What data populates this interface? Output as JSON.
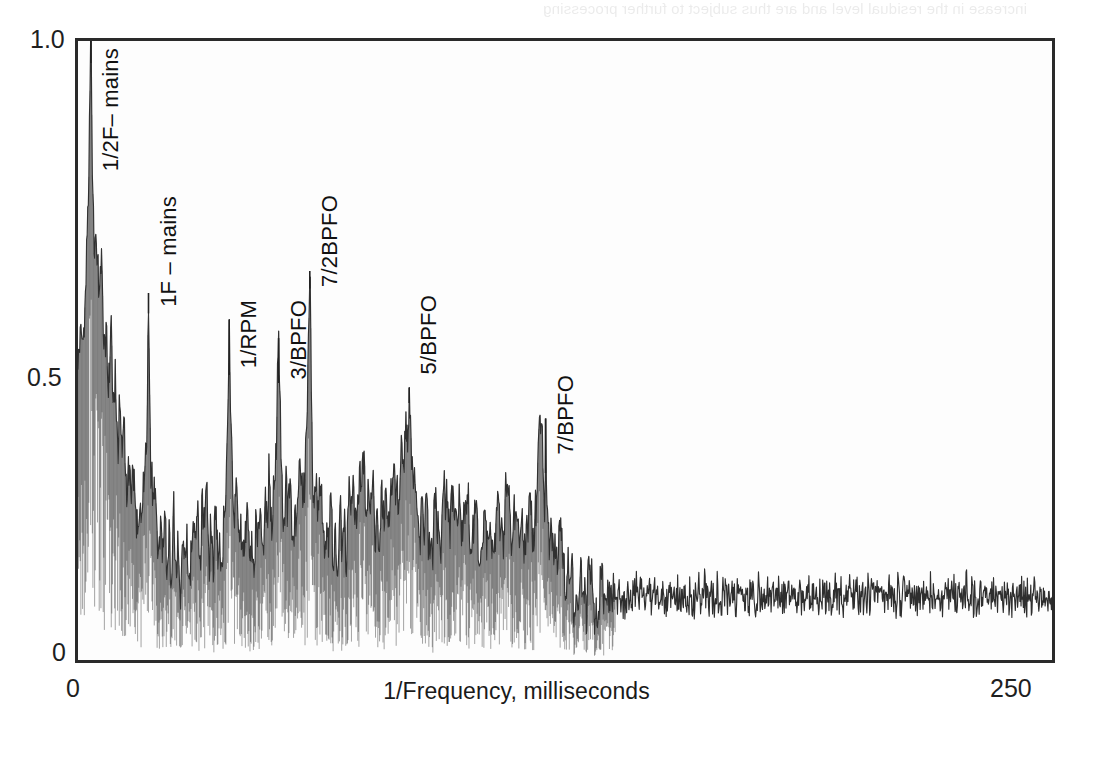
{
  "figure": {
    "title_line1": "A Cepstrum indicating peaks",
    "title_line2": "of families of harmonics"
  },
  "axes": {
    "y_tick_top": "1.0",
    "y_tick_mid": "0.5",
    "y_tick_bottom": "0",
    "x_tick_left": "0",
    "x_tick_right": "250",
    "x_title": "1/Frequency, milliseconds"
  },
  "annotations": [
    {
      "label": "1/2F– mains",
      "x_ms": 3.3
    },
    {
      "label": "1F – mains",
      "x_ms": 18.1
    },
    {
      "label": "1/RPM",
      "x_ms": 38.8
    },
    {
      "label": "3/BPFO",
      "x_ms": 51.5
    },
    {
      "label": "7/2BPFO",
      "x_ms": 59.5
    },
    {
      "label": "5/BPFO",
      "x_ms": 85.0
    },
    {
      "label": "7/BPFO",
      "x_ms": 120.0
    }
  ],
  "bleed_through": {
    "top_line": "increase in the residual level and are thus subject to further processing",
    "body_lines": [
      "spectra, and that they appear to be harmonics or sidebands of some kind",
      "",
      "",
      "level of residual signal and the noise floor of the measurement",
      "are separated in the cepstrum domain by the quefrency",
      "",
      "",
      "",
      "",
      "the cepstrum of a signal containing a family of harmonics",
      "which are uniformly spaced will show a peak at the quefrency",
      "corresponding to the spacing of the family members",
      "",
      "",
      "",
      ""
    ]
  },
  "chart_data": {
    "type": "line",
    "title": "A Cepstrum indicating peaks of families of harmonics",
    "xlabel": "1/Frequency, milliseconds",
    "ylabel": "",
    "xlim": [
      0,
      250
    ],
    "ylim": [
      0,
      1.0
    ],
    "xticks": [
      0,
      250
    ],
    "yticks": [
      0,
      0.5,
      1.0
    ],
    "grid": false,
    "legend": "none",
    "series_name": "cepstrum amplitude",
    "labeled_peaks": [
      {
        "name": "1/2F– mains",
        "x": 3.3,
        "y": 1.0
      },
      {
        "name": "1F – mains",
        "x": 18.1,
        "y": 0.56
      },
      {
        "name": "1/RPM",
        "x": 38.8,
        "y": 0.55
      },
      {
        "name": "3/BPFO",
        "x": 51.5,
        "y": 0.52
      },
      {
        "name": "7/2BPFO",
        "x": 59.5,
        "y": 0.6
      },
      {
        "name": "5/BPFO",
        "x": 85.0,
        "y": 0.44
      },
      {
        "name": "7/BPFO",
        "x": 120.0,
        "y": 0.39
      }
    ],
    "x": [
      0.0,
      0.6,
      1.2,
      1.8,
      2.4,
      3.0,
      3.3,
      3.6,
      4.2,
      4.8,
      5.4,
      6.0,
      6.6,
      7.2,
      7.8,
      8.4,
      9.0,
      9.6,
      10.2,
      10.8,
      11.4,
      12.0,
      12.6,
      13.2,
      13.8,
      14.4,
      15.0,
      15.6,
      16.2,
      16.8,
      17.4,
      18.1,
      18.6,
      19.2,
      19.8,
      20.4,
      21.0,
      21.6,
      22.2,
      22.8,
      23.4,
      24.0,
      24.6,
      25.2,
      25.8,
      26.4,
      27.0,
      27.6,
      28.2,
      28.8,
      29.4,
      30.0,
      30.6,
      31.2,
      31.8,
      32.4,
      33.0,
      33.6,
      34.2,
      34.8,
      35.4,
      36.0,
      36.6,
      37.2,
      37.8,
      38.4,
      38.8,
      39.6,
      40.2,
      40.8,
      41.4,
      42.0,
      42.6,
      43.2,
      43.8,
      44.4,
      45.0,
      45.6,
      46.2,
      46.8,
      47.4,
      48.0,
      48.6,
      49.2,
      49.8,
      50.4,
      51.0,
      51.5,
      52.2,
      52.8,
      53.4,
      54.0,
      54.6,
      55.2,
      55.8,
      56.4,
      57.0,
      57.6,
      58.2,
      58.8,
      59.5,
      60.0,
      60.6,
      61.2,
      61.8,
      62.4,
      63.0,
      63.6,
      64.2,
      64.8,
      65.4,
      66.0,
      66.6,
      67.2,
      67.8,
      68.4,
      69.0,
      69.6,
      70.2,
      70.8,
      71.4,
      72.0,
      72.6,
      73.2,
      73.8,
      74.4,
      75.0,
      75.6,
      76.2,
      76.8,
      77.4,
      78.0,
      78.6,
      79.2,
      79.8,
      80.4,
      81.0,
      81.6,
      82.2,
      82.8,
      83.4,
      84.0,
      84.6,
      85.0,
      85.8,
      86.4,
      87.0,
      87.6,
      88.2,
      88.8,
      89.4,
      90.0,
      91.0,
      92.0,
      93.0,
      94.0,
      95.0,
      96.0,
      97.0,
      98.0,
      99.0,
      100.0,
      101.0,
      102.0,
      103.0,
      104.0,
      105.0,
      106.0,
      107.0,
      108.0,
      109.0,
      110.0,
      111.0,
      112.0,
      113.0,
      114.0,
      115.0,
      116.0,
      117.0,
      118.0,
      119.0,
      120.0,
      121.0,
      122.0,
      123.0,
      124.0,
      125.0,
      127.0,
      129.0,
      131.0,
      133.0,
      135.0,
      137.0,
      139.0,
      141.0,
      143.0,
      145.0,
      147.0,
      149.0,
      151.0,
      153.0,
      155.0,
      157.0,
      159.0,
      161.0,
      163.0,
      165.0,
      167.0,
      169.0,
      171.0,
      173.0,
      175.0,
      177.0,
      179.0,
      181.0,
      183.0,
      185.0,
      187.0,
      189.0,
      191.0,
      193.0,
      195.0,
      197.0,
      199.0,
      201.0,
      203.0,
      205.0,
      207.0,
      209.0,
      211.0,
      213.0,
      215.0,
      217.0,
      219.0,
      221.0,
      223.0,
      225.0,
      227.0,
      229.0,
      231.0,
      233.0,
      235.0,
      237.0,
      239.0,
      241.0,
      243.0,
      245.0,
      247.0,
      249.0,
      250.0
    ],
    "y": [
      0.42,
      0.55,
      0.47,
      0.62,
      0.7,
      0.86,
      1.0,
      0.83,
      0.66,
      0.72,
      0.58,
      0.64,
      0.5,
      0.56,
      0.45,
      0.52,
      0.4,
      0.46,
      0.36,
      0.41,
      0.32,
      0.37,
      0.28,
      0.33,
      0.25,
      0.3,
      0.22,
      0.27,
      0.2,
      0.25,
      0.33,
      0.56,
      0.34,
      0.22,
      0.28,
      0.18,
      0.24,
      0.16,
      0.22,
      0.15,
      0.21,
      0.14,
      0.2,
      0.13,
      0.19,
      0.12,
      0.18,
      0.13,
      0.2,
      0.15,
      0.22,
      0.17,
      0.24,
      0.19,
      0.26,
      0.2,
      0.25,
      0.18,
      0.23,
      0.16,
      0.21,
      0.15,
      0.2,
      0.18,
      0.25,
      0.33,
      0.55,
      0.3,
      0.22,
      0.26,
      0.18,
      0.24,
      0.17,
      0.22,
      0.16,
      0.21,
      0.15,
      0.2,
      0.17,
      0.23,
      0.19,
      0.26,
      0.21,
      0.28,
      0.23,
      0.3,
      0.35,
      0.52,
      0.3,
      0.24,
      0.28,
      0.22,
      0.26,
      0.2,
      0.25,
      0.24,
      0.3,
      0.27,
      0.34,
      0.4,
      0.6,
      0.36,
      0.26,
      0.3,
      0.22,
      0.27,
      0.2,
      0.25,
      0.18,
      0.23,
      0.17,
      0.22,
      0.16,
      0.21,
      0.18,
      0.24,
      0.2,
      0.26,
      0.22,
      0.28,
      0.24,
      0.3,
      0.26,
      0.32,
      0.24,
      0.3,
      0.22,
      0.27,
      0.2,
      0.25,
      0.18,
      0.23,
      0.21,
      0.27,
      0.23,
      0.29,
      0.25,
      0.31,
      0.27,
      0.33,
      0.29,
      0.35,
      0.38,
      0.44,
      0.3,
      0.24,
      0.28,
      0.21,
      0.26,
      0.19,
      0.24,
      0.22,
      0.18,
      0.24,
      0.2,
      0.26,
      0.22,
      0.28,
      0.21,
      0.27,
      0.2,
      0.25,
      0.19,
      0.24,
      0.18,
      0.23,
      0.17,
      0.22,
      0.19,
      0.25,
      0.21,
      0.27,
      0.2,
      0.26,
      0.19,
      0.24,
      0.18,
      0.23,
      0.22,
      0.28,
      0.39,
      0.25,
      0.18,
      0.22,
      0.16,
      0.2,
      0.14,
      0.12,
      0.1,
      0.13,
      0.09,
      0.12,
      0.08,
      0.11,
      0.09,
      0.12,
      0.08,
      0.11,
      0.09,
      0.12,
      0.08,
      0.11,
      0.09,
      0.13,
      0.08,
      0.11,
      0.09,
      0.12,
      0.08,
      0.11,
      0.09,
      0.12,
      0.08,
      0.11,
      0.09,
      0.13,
      0.08,
      0.11,
      0.09,
      0.12,
      0.08,
      0.11,
      0.09,
      0.12,
      0.08,
      0.11,
      0.09,
      0.12,
      0.08,
      0.11,
      0.09,
      0.12,
      0.08,
      0.11,
      0.09,
      0.12,
      0.08,
      0.11,
      0.09,
      0.12,
      0.08,
      0.11,
      0.09
    ]
  }
}
